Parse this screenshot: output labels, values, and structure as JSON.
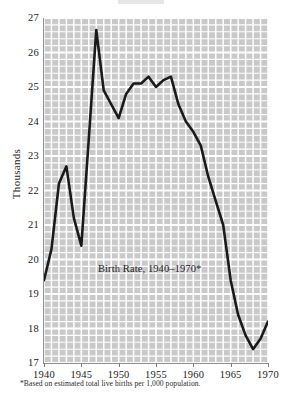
{
  "chart_data": {
    "type": "line",
    "title": "",
    "caption": "Birth Rate, 1940–1970*",
    "footnote": "*Based on estimated total live births per 1,000 population.",
    "xlabel": "",
    "ylabel": "Thousands",
    "xlim": [
      1940,
      1970
    ],
    "ylim": [
      17,
      27
    ],
    "grid": true,
    "legend": null,
    "y_ticks": [
      27,
      26,
      25,
      24,
      23,
      22,
      21,
      20,
      19,
      18,
      17
    ],
    "y_tick_labels": [
      "27",
      "26",
      "25",
      "24",
      "23",
      "22",
      "21",
      "20",
      "19",
      "18",
      "17"
    ],
    "x_ticks": [
      1940,
      1945,
      1950,
      1955,
      1960,
      1965,
      1970
    ],
    "x_tick_labels": [
      "1940",
      "1945",
      "1950",
      "1955",
      "1960",
      "1965",
      "1970"
    ],
    "x_minor_step": 1,
    "y_minor_step": 0.2,
    "line_color": "#1a1a1a",
    "plot_background": "#c9c9c9",
    "gridline_color": "#ffffff",
    "x": [
      1940,
      1941,
      1942,
      1943,
      1944,
      1945,
      1946,
      1947,
      1948,
      1949,
      1950,
      1951,
      1952,
      1953,
      1954,
      1955,
      1956,
      1957,
      1958,
      1959,
      1960,
      1961,
      1962,
      1963,
      1964,
      1965,
      1966,
      1967,
      1968,
      1969,
      1970
    ],
    "values": [
      19.4,
      20.3,
      22.2,
      22.7,
      21.2,
      20.4,
      23.5,
      26.65,
      24.9,
      24.5,
      24.1,
      24.8,
      25.1,
      25.1,
      25.3,
      25.0,
      25.2,
      25.3,
      24.5,
      24.0,
      23.7,
      23.3,
      22.4,
      21.7,
      21.0,
      19.4,
      18.4,
      17.8,
      17.4,
      17.7,
      18.2
    ],
    "annotations": [
      {
        "label": "peak",
        "x": 1947,
        "y": 26.65
      },
      {
        "label": "trough",
        "x": 1968,
        "y": 17.4
      }
    ]
  },
  "axes": {
    "y_title": "Thousands"
  }
}
